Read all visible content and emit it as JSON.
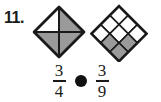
{
  "item": {
    "number_label": "11.",
    "type": "fraction-comparison-problem"
  },
  "figures": {
    "left": {
      "name": "square-divided-into-fourths",
      "shape": "diamond",
      "total_parts": 4,
      "shaded_parts": 3,
      "fraction_text": "3/4",
      "division": "two-diagonals",
      "parts": [
        {
          "position": "top-left",
          "shaded": false
        },
        {
          "position": "top-right",
          "shaded": true
        },
        {
          "position": "bottom-left",
          "shaded": true
        },
        {
          "position": "bottom-right",
          "shaded": true
        }
      ]
    },
    "right": {
      "name": "square-divided-into-ninths",
      "shape": "diamond",
      "total_parts": 9,
      "shaded_parts": 3,
      "fraction_text": "3/9",
      "division": "three-by-three-grid",
      "grid": [
        [
          false,
          false,
          false
        ],
        [
          false,
          false,
          true
        ],
        [
          false,
          true,
          true
        ]
      ]
    }
  },
  "comparison": {
    "left_fraction": {
      "numerator": "3",
      "denominator": "4"
    },
    "operator_symbol": "",
    "operator_placeholder_name": "answer-dot",
    "right_fraction": {
      "numerator": "3",
      "denominator": "9"
    }
  },
  "colors": {
    "shaded_fill": "#9a9a9a",
    "unshaded_fill": "#ffffff",
    "outline": "#1a1a1a",
    "text": "#1a1a1a",
    "dot": "#111111",
    "background": "#ffffff"
  }
}
